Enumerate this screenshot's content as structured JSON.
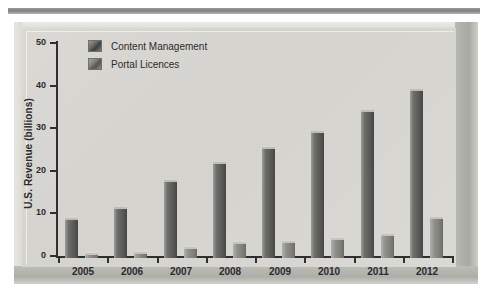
{
  "chart_data": {
    "type": "bar",
    "title": "",
    "subtitle": "",
    "xlabel": "",
    "ylabel": "U.S. Revenue (billions)",
    "categories": [
      "2005",
      "2006",
      "2007",
      "2008",
      "2009",
      "2010",
      "2011",
      "2012"
    ],
    "series": [
      {
        "name": "Content Management",
        "values": [
          9.3,
          12.0,
          18.2,
          22.5,
          26.0,
          29.8,
          34.7,
          39.6
        ]
      },
      {
        "name": "Portal Licences",
        "values": [
          1.2,
          1.4,
          2.6,
          3.8,
          4.0,
          4.8,
          5.6,
          9.7
        ]
      }
    ],
    "ylim": [
      0,
      50
    ],
    "yticks": [
      0,
      10,
      20,
      30,
      40,
      50
    ],
    "ytick_labels": [
      "0",
      "10",
      "20",
      "30",
      "40",
      "50"
    ],
    "grid": false,
    "legend_position": "top-left",
    "colors": {
      "content_management": "#5e5e5a",
      "portal_licences": "#84847f",
      "axis": "#2f2f2f",
      "plot_background": "#d9d7d2",
      "frame": "#c9c9c4",
      "text": "#2b2b2b"
    }
  },
  "legend": {
    "items": [
      {
        "label": "Content Management",
        "swatch": "legend-swatch-content-management"
      },
      {
        "label": "Portal Licences",
        "swatch": "legend-swatch-portal-licences"
      }
    ]
  },
  "axes": {
    "y_axis_title": "U.S. Revenue (billions)"
  }
}
